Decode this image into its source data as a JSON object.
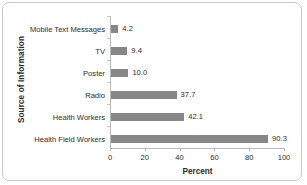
{
  "chart_data": {
    "type": "bar",
    "orientation": "horizontal",
    "title": "",
    "xlabel": "Percent",
    "ylabel": "Source of Information",
    "categories": [
      "Mobile Text Messages",
      "TV",
      "Poster",
      "Radio",
      "Health Workers",
      "Health Field Workers"
    ],
    "values": [
      4.2,
      9.4,
      10.0,
      37.7,
      42.1,
      90.3
    ],
    "value_labels": [
      "4.2",
      "9.4",
      "10.0",
      "37.7",
      "42.1",
      "90.3"
    ],
    "xlim": [
      0,
      100
    ],
    "xticks": [
      0,
      20,
      40,
      60,
      80,
      100
    ],
    "xtick_labels": [
      "0",
      "20",
      "40",
      "60",
      "80",
      "100"
    ],
    "grid": false,
    "legend": false,
    "bar_color": "#878787",
    "axis_color": "#b9b9b9",
    "text_color": "#2b2b2b",
    "frame_color": "#c9c9c9"
  }
}
